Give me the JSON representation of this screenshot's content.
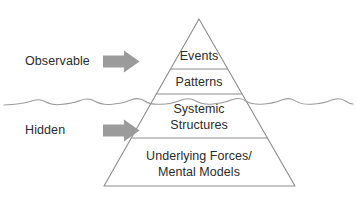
{
  "diagram": {
    "background_color": "#ffffff",
    "outline_color": "#8c8c8c",
    "text_color": "#2b2b2b",
    "arrow_color": "#9b9b9b",
    "waterline_color": "#9a9a9a"
  },
  "side_labels": [
    {
      "id": "observable",
      "label": "Observable",
      "arrow_icon": "right-arrow-icon"
    },
    {
      "id": "hidden",
      "label": "Hidden",
      "arrow_icon": "right-arrow-icon"
    }
  ],
  "tiers": [
    {
      "id": "events",
      "label": "Events",
      "lines": [
        "Events"
      ]
    },
    {
      "id": "patterns",
      "label": "Patterns",
      "lines": [
        "Patterns"
      ]
    },
    {
      "id": "systemic-structures",
      "label": "Systemic Structures",
      "lines": [
        "Systemic",
        "Structures"
      ]
    },
    {
      "id": "underlying-forces",
      "label": "Underlying Forces/ Mental Models",
      "lines": [
        "Underlying Forces/",
        "Mental Models"
      ]
    }
  ],
  "waterline": {
    "id": "waterline",
    "label": "water surface wavy line"
  }
}
